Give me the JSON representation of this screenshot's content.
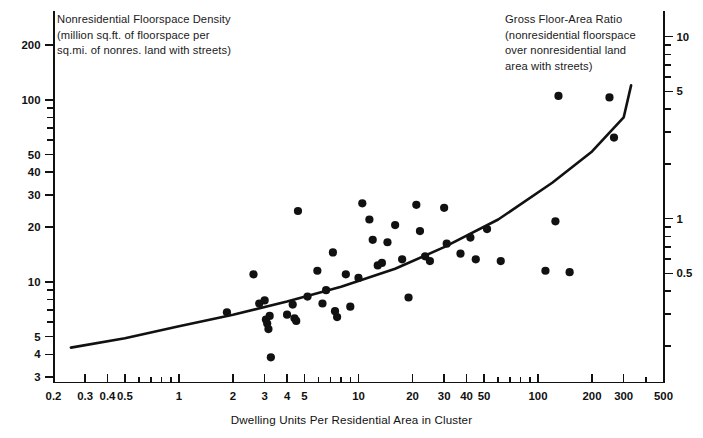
{
  "chart_data": {
    "type": "scatter",
    "title": "",
    "xlabel": "Dwelling Units Per Residential Area in Cluster",
    "ylabel_left": "Nonresidential Floorspace Density\n(million sq.ft. of floorspace per\nsq.mi. of nonres. land with streets)",
    "ylabel_right": "Gross Floor-Area Ratio\n(nonresidential floorspace\nover nonresidential land\narea with streets)",
    "xscale": "log",
    "yscale": "log",
    "xlim": [
      0.2,
      500
    ],
    "ylim_left": [
      3,
      260
    ],
    "ylim_right": [
      0.1,
      10
    ],
    "grid": false,
    "legend": null,
    "xticks_labeled": [
      0.2,
      0.3,
      0.4,
      0.5,
      1,
      2,
      3,
      4,
      5,
      10,
      20,
      30,
      40,
      50,
      100,
      200,
      300,
      500
    ],
    "xtick_labels": [
      "0.2",
      "0.3",
      "0.4",
      "0.5",
      "1",
      "2",
      "3",
      "4",
      "5",
      "10",
      "20",
      "30",
      "40",
      "50",
      "100",
      "200",
      "300",
      "500"
    ],
    "yticks_left_labeled": [
      3,
      4,
      5,
      10,
      20,
      30,
      40,
      50,
      100,
      200
    ],
    "ytick_left_labels": [
      "3",
      "4",
      "5",
      "10",
      "20",
      "30",
      "40",
      "50",
      "100",
      "200"
    ],
    "yticks_right_labeled": [
      0.1,
      0.5,
      1,
      5,
      10
    ],
    "ytick_right_labels": [
      "0.1",
      "0.5",
      "1",
      "5",
      "10"
    ],
    "points": [
      [
        1.85,
        6.8
      ],
      [
        2.6,
        11.0
      ],
      [
        2.8,
        7.6
      ],
      [
        3.0,
        7.9
      ],
      [
        3.05,
        6.2
      ],
      [
        3.1,
        5.9
      ],
      [
        3.15,
        5.5
      ],
      [
        3.2,
        6.5
      ],
      [
        3.25,
        3.85
      ],
      [
        4.0,
        6.6
      ],
      [
        4.3,
        7.5
      ],
      [
        4.4,
        6.3
      ],
      [
        4.5,
        6.1
      ],
      [
        4.6,
        24.5
      ],
      [
        5.2,
        8.3
      ],
      [
        5.9,
        11.5
      ],
      [
        6.3,
        7.6
      ],
      [
        6.6,
        9.0
      ],
      [
        7.2,
        14.5
      ],
      [
        7.4,
        6.9
      ],
      [
        7.6,
        6.4
      ],
      [
        8.5,
        11.0
      ],
      [
        9.0,
        7.3
      ],
      [
        10.0,
        10.5
      ],
      [
        10.5,
        27.0
      ],
      [
        11.5,
        22.0
      ],
      [
        12.0,
        17.0
      ],
      [
        12.8,
        12.3
      ],
      [
        13.5,
        12.7
      ],
      [
        14.5,
        16.5
      ],
      [
        16.0,
        20.5
      ],
      [
        17.5,
        13.3
      ],
      [
        19.0,
        8.2
      ],
      [
        21.0,
        26.5
      ],
      [
        22.0,
        19.0
      ],
      [
        23.5,
        13.8
      ],
      [
        25.0,
        13.0
      ],
      [
        30.0,
        25.5
      ],
      [
        31.0,
        16.2
      ],
      [
        37.0,
        14.3
      ],
      [
        42.0,
        17.5
      ],
      [
        45.0,
        13.3
      ],
      [
        52.0,
        19.5
      ],
      [
        62.0,
        13.0
      ],
      [
        110.0,
        11.5
      ],
      [
        125.0,
        21.5
      ],
      [
        130.0,
        105.0
      ],
      [
        150.0,
        11.3
      ],
      [
        250.0,
        103.0
      ],
      [
        265.0,
        62.0
      ]
    ],
    "trend_line": {
      "description": "fitted upward-curving regression line",
      "points": [
        [
          0.25,
          4.35
        ],
        [
          0.5,
          4.9
        ],
        [
          1.0,
          5.7
        ],
        [
          2.0,
          6.6
        ],
        [
          4.0,
          7.8
        ],
        [
          8.0,
          9.4
        ],
        [
          16.0,
          11.8
        ],
        [
          30.0,
          15.5
        ],
        [
          60.0,
          22.0
        ],
        [
          120.0,
          35.0
        ],
        [
          200.0,
          52.0
        ],
        [
          300.0,
          80.0
        ],
        [
          330.0,
          120.0
        ]
      ]
    }
  }
}
